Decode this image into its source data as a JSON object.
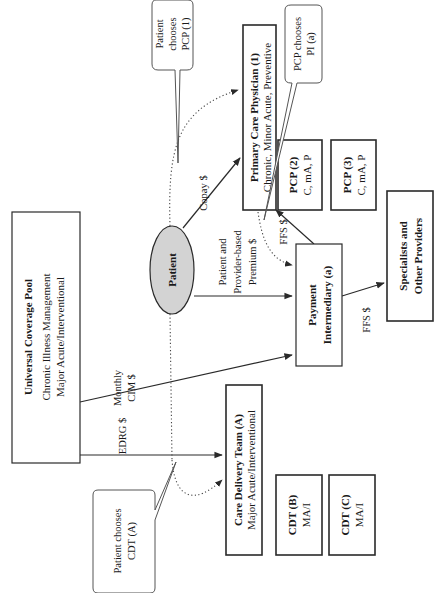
{
  "diagram": {
    "colors": {
      "line": "#2a2a2a",
      "patient_fill": "#d3d3d3",
      "background": "#ffffff"
    },
    "nodes": {
      "pool": {
        "title": "Universal Coverage Pool",
        "line1": "Chronic Illness Management",
        "line2": "Major Acute/Interventional"
      },
      "patient": {
        "title": "Patient"
      },
      "pcp1": {
        "title": "Primary Care Physician (1)",
        "line1": "Chronic, Minor Acute, Preventive"
      },
      "pcp2": {
        "title": "PCP (2)",
        "line1": "C, mA, P"
      },
      "pcp3": {
        "title": "PCP (3)",
        "line1": "C, mA, P"
      },
      "pi": {
        "title": "Payment",
        "line1": "Intermediary (a)"
      },
      "specialists": {
        "title": "Specialists and",
        "line1": "Other Providers"
      },
      "cdtA": {
        "title": "Care Delivery Team (A)",
        "line1": "Major Acute/Interventional"
      },
      "cdtB": {
        "title": "CDT (B)",
        "line1": "MA/I"
      },
      "cdtC": {
        "title": "CDT (C)",
        "line1": "MA/I"
      }
    },
    "edge_labels": {
      "copay": "Copay $",
      "premium_l1": "Patient and",
      "premium_l2": "Provider-based",
      "premium_l3": "Premium  $",
      "monthly_l1": "Monthly",
      "monthly_l2": "CIM $",
      "edrg": "EDRG $",
      "ffs_pcp": "FFS $",
      "ffs_spec": "FFS $"
    },
    "callouts": {
      "patient_pcp": {
        "l1": "Patient",
        "l2": "chooses",
        "l3": "PCP (1)"
      },
      "pcp_pi": {
        "l1": "PCP chooses",
        "l2": "PI (a)"
      },
      "patient_cdt": {
        "l1": "Patient chooses",
        "l2": "CDT (A)"
      }
    }
  }
}
